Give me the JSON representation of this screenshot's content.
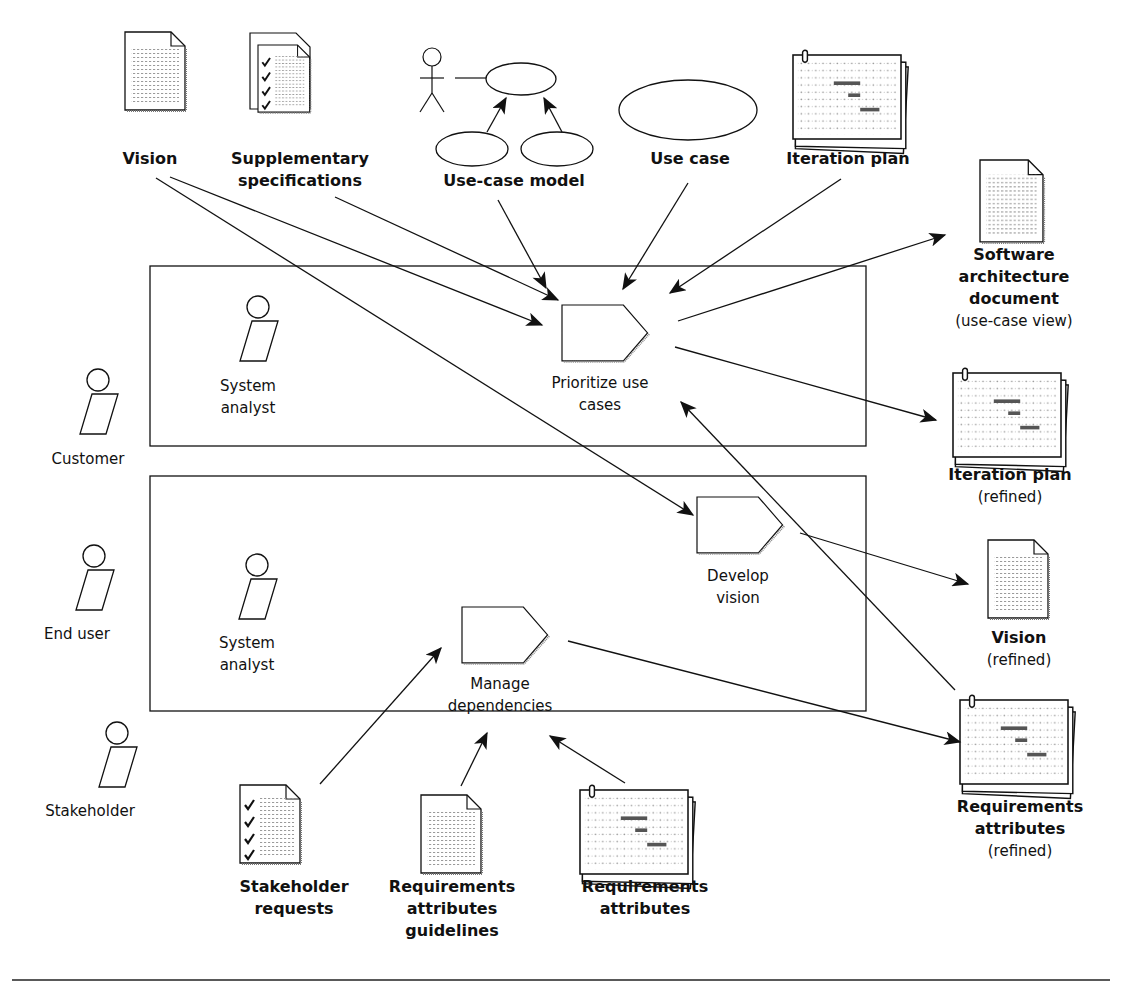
{
  "diagram": {
    "inputs_top": [
      {
        "id": "vision",
        "label": [
          "Vision"
        ],
        "icon": "document-icon"
      },
      {
        "id": "supplementary",
        "label": [
          "Supplementary",
          "specifications"
        ],
        "icon": "checklist-document-icon"
      },
      {
        "id": "use_case_model",
        "label": [
          "Use-case model"
        ],
        "icon": "use-case-model-icon"
      },
      {
        "id": "use_case",
        "label": [
          "Use case"
        ],
        "icon": "use-case-ellipse-icon"
      },
      {
        "id": "iteration_plan",
        "label": [
          "Iteration plan"
        ],
        "icon": "plan-stack-icon"
      }
    ],
    "outputs_right": [
      {
        "id": "sad",
        "label_bold": [
          "Software",
          "architecture",
          "document"
        ],
        "label_note": "(use-case view)",
        "icon": "document-icon"
      },
      {
        "id": "iteration_plan_refined",
        "label_bold": [
          "Iteration plan"
        ],
        "label_note": "(refined)",
        "icon": "plan-stack-icon"
      },
      {
        "id": "vision_refined",
        "label_bold": [
          "Vision"
        ],
        "label_note": "(refined)",
        "icon": "document-icon"
      },
      {
        "id": "req_attr_refined",
        "label_bold": [
          "Requirements",
          "attributes"
        ],
        "label_note": "(refined)",
        "icon": "plan-stack-icon"
      }
    ],
    "inputs_bottom": [
      {
        "id": "stakeholder_requests",
        "label": [
          "Stakeholder",
          "requests"
        ],
        "icon": "checklist-document-icon"
      },
      {
        "id": "req_attr_guidelines",
        "label": [
          "Requirements",
          "attributes",
          "guidelines"
        ],
        "icon": "document-icon"
      },
      {
        "id": "req_attr",
        "label": [
          "Requirements",
          "attributes"
        ],
        "icon": "plan-stack-icon"
      }
    ],
    "actors_outside": [
      {
        "id": "customer",
        "label": "Customer"
      },
      {
        "id": "end_user",
        "label": "End user"
      },
      {
        "id": "stakeholder",
        "label": "Stakeholder"
      }
    ],
    "swimlanes": [
      {
        "id": "lane_top",
        "worker": [
          "System",
          "analyst"
        ],
        "activities": [
          {
            "id": "prioritize",
            "label": [
              "Prioritize use",
              "cases"
            ]
          }
        ]
      },
      {
        "id": "lane_bottom",
        "worker": [
          "System",
          "analyst"
        ],
        "activities": [
          {
            "id": "develop_vision",
            "label": [
              "Develop",
              "vision"
            ]
          },
          {
            "id": "manage_deps",
            "label": [
              "Manage",
              "dependencies"
            ]
          }
        ]
      }
    ],
    "colors": {
      "line": "#111111",
      "background": "#ffffff",
      "stipple": "#888888"
    }
  }
}
